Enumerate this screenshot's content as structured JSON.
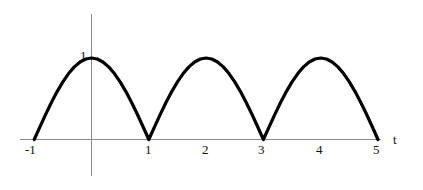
{
  "chart_data": {
    "type": "line",
    "title": "",
    "xlabel": "t",
    "ylabel": "",
    "xlim": [
      -1.25,
      5.7
    ],
    "ylim": [
      -0.45,
      1.55
    ],
    "grid": false,
    "legend": null,
    "curve_description": "rectified sinusoid |sin(pi*t/2)| style humps, period 2, amplitude 1",
    "x_tick_labels": [
      "-1",
      "1",
      "2",
      "3",
      "4",
      "5"
    ],
    "x_tick_values": [
      -1,
      1,
      2,
      3,
      4,
      5
    ],
    "y_tick_labels": [
      "1"
    ],
    "y_tick_values": [
      1
    ],
    "peaks": [
      {
        "x": 0,
        "y": 1
      },
      {
        "x": 2,
        "y": 1
      },
      {
        "x": 4,
        "y": 1
      }
    ],
    "zeros": [
      -1,
      1,
      3,
      5
    ],
    "x": [
      -1,
      -0.9,
      -0.8,
      -0.7,
      -0.6,
      -0.5,
      -0.4,
      -0.3,
      -0.2,
      -0.1,
      0,
      0.1,
      0.2,
      0.3,
      0.4,
      0.5,
      0.6,
      0.7,
      0.8,
      0.9,
      1,
      1.1,
      1.2,
      1.3,
      1.4,
      1.5,
      1.6,
      1.7,
      1.8,
      1.9,
      2,
      2.1,
      2.2,
      2.3,
      2.4,
      2.5,
      2.6,
      2.7,
      2.8,
      2.9,
      3,
      3.1,
      3.2,
      3.3,
      3.4,
      3.5,
      3.6,
      3.7,
      3.8,
      3.9,
      4,
      4.1,
      4.2,
      4.3,
      4.4,
      4.5,
      4.6,
      4.7,
      4.8,
      4.9,
      5
    ],
    "y": [
      0,
      0.156,
      0.309,
      0.454,
      0.588,
      0.707,
      0.809,
      0.891,
      0.951,
      0.988,
      1,
      0.988,
      0.951,
      0.891,
      0.809,
      0.707,
      0.588,
      0.454,
      0.309,
      0.156,
      0,
      0.156,
      0.309,
      0.454,
      0.588,
      0.707,
      0.809,
      0.891,
      0.951,
      0.988,
      1,
      0.988,
      0.951,
      0.891,
      0.809,
      0.707,
      0.588,
      0.454,
      0.309,
      0.156,
      0,
      0.156,
      0.309,
      0.454,
      0.588,
      0.707,
      0.809,
      0.891,
      0.951,
      0.988,
      1,
      0.988,
      0.951,
      0.891,
      0.809,
      0.707,
      0.588,
      0.454,
      0.309,
      0.156,
      0
    ],
    "colors": {
      "curve": "#000000",
      "axis": "#8a8a8a",
      "text": "#111111",
      "background": "#ffffff"
    }
  },
  "labels": {
    "x_axis_name": "t",
    "y_one": "1",
    "x_minus_one": "-1",
    "x_one": "1",
    "x_two": "2",
    "x_three": "3",
    "x_four": "4",
    "x_five": "5"
  }
}
